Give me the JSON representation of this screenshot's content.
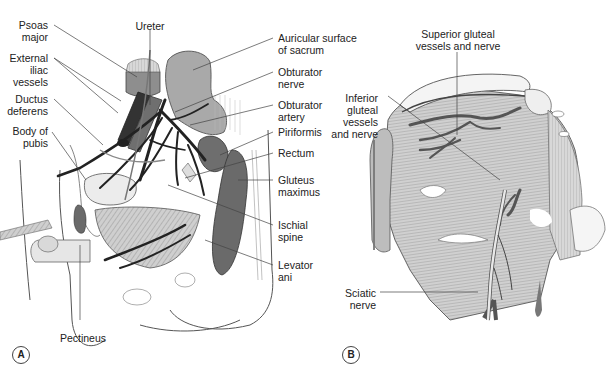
{
  "figure": {
    "panels": [
      {
        "id": "A",
        "labels_left": [
          {
            "text": "Psoas\nmajor"
          },
          {
            "text": "External\niliac\nvessels"
          },
          {
            "text": "Ductus\ndeferens"
          },
          {
            "text": "Body of\npubis"
          }
        ],
        "label_top": {
          "text": "Ureter"
        },
        "labels_right": [
          {
            "text": "Auricular surface\nof sacrum"
          },
          {
            "text": "Obturator\nnerve"
          },
          {
            "text": "Obturator\nartery"
          },
          {
            "text": "Piriformis"
          },
          {
            "text": "Rectum"
          },
          {
            "text": "Gluteus\nmaximus"
          },
          {
            "text": "Ischial\nspine"
          },
          {
            "text": "Levator\nani"
          }
        ],
        "label_bottom": {
          "text": "Pectineus"
        }
      },
      {
        "id": "B",
        "label_top": {
          "text": "Superior gluteal\nvessels and nerve"
        },
        "labels_left": [
          {
            "text": "Inferior\ngluteal\nvessels\nand nerve"
          },
          {
            "text": "Sciatic\nnerve"
          }
        ]
      }
    ],
    "colors": {
      "muscle_light": "#c8c8c8",
      "muscle_dark": "#6e6e6e",
      "vessel": "#2a2a2a",
      "bone": "#f2f2f2",
      "line": "#444444"
    }
  }
}
